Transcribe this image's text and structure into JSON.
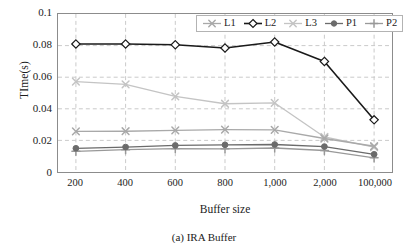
{
  "figure": {
    "caption": "(a) IRA Buffer"
  },
  "chart_data": {
    "type": "line",
    "title": "",
    "subtitle": "",
    "xlabel": "Buffer size",
    "ylabel": "TIme(s)",
    "categories": [
      "200",
      "400",
      "600",
      "800",
      "1,000",
      "2,000",
      "100,000"
    ],
    "ylim": [
      0,
      0.1
    ],
    "ytick_labels": [
      "0",
      "0.02",
      "0.04",
      "0.06",
      "0.08",
      "0.1"
    ],
    "ytick_values": [
      0,
      0.02,
      0.04,
      0.06,
      0.08,
      0.1
    ],
    "grid": true,
    "grid_style": "dashed",
    "legend_position": "top-right",
    "series": [
      {
        "name": "L1",
        "color": "#a9a9a9",
        "marker": "x",
        "values": [
          0.0257,
          0.0258,
          0.0263,
          0.0268,
          0.0267,
          0.0212,
          0.0163
        ]
      },
      {
        "name": "L2",
        "color": "#1a1a1a",
        "marker": "diamond-open",
        "values": [
          0.081,
          0.081,
          0.0805,
          0.0785,
          0.0823,
          0.07,
          0.033
        ]
      },
      {
        "name": "L3",
        "color": "#c4c4c4",
        "marker": "x",
        "values": [
          0.0572,
          0.0555,
          0.0478,
          0.0432,
          0.0437,
          0.0222,
          0.0157
        ]
      },
      {
        "name": "P1",
        "color": "#6b6b6b",
        "marker": "circle-filled",
        "values": [
          0.015,
          0.0158,
          0.0168,
          0.0172,
          0.0174,
          0.0161,
          0.0112
        ]
      },
      {
        "name": "P2",
        "color": "#999999",
        "marker": "plus",
        "values": [
          0.0131,
          0.0141,
          0.0148,
          0.0147,
          0.0152,
          0.0136,
          0.009
        ]
      }
    ]
  }
}
